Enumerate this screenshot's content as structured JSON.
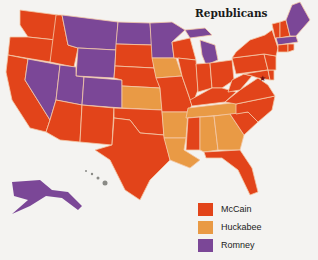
{
  "title": "Republicans",
  "colors": {
    "mccain": "#e2441a",
    "huckabee": "#e99a45",
    "romney": "#7b4797",
    "hawaii": "#8a8a86",
    "border": "#f4c9a8",
    "background": "#f4f3f1"
  },
  "legend": [
    {
      "label": "McCain",
      "color": "#e2441a"
    },
    {
      "label": "Huckabee",
      "color": "#e99a45"
    },
    {
      "label": "Romney",
      "color": "#7b4797"
    }
  ],
  "states": {
    "McCain": [
      "WA",
      "OR",
      "CA",
      "ID",
      "AZ",
      "NM",
      "TX",
      "OK",
      "SD",
      "NE",
      "MO",
      "IL",
      "WI",
      "IN",
      "OH",
      "KY",
      "MS",
      "FL",
      "SC",
      "NC",
      "VA",
      "WV",
      "PA",
      "NY",
      "NJ",
      "DE",
      "MD",
      "CT",
      "RI",
      "VT",
      "NH"
    ],
    "Huckabee": [
      "KS",
      "IA",
      "AR",
      "LA",
      "TN",
      "AL",
      "GA"
    ],
    "Romney": [
      "NV",
      "MT",
      "WY",
      "UT",
      "CO",
      "ND",
      "MN",
      "MI",
      "ME",
      "MA",
      "AK"
    ]
  }
}
